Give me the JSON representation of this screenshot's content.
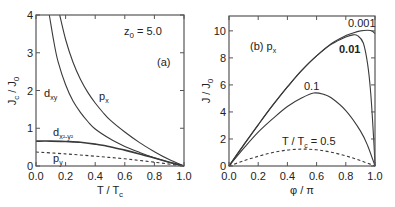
{
  "chart_data": [
    {
      "type": "line",
      "panel": "(a)",
      "annotation": "z0 = 5.0",
      "xlabel": "T / Tc",
      "ylabel": "Jc / J0",
      "xlim": [
        0.0,
        1.0
      ],
      "ylim": [
        0,
        4
      ],
      "xticks": [
        "0.0",
        "0.2",
        "0.4",
        "0.6",
        "0.8",
        "1.0"
      ],
      "yticks": [
        "0",
        "1",
        "2",
        "3",
        "4"
      ],
      "grid": false,
      "series": [
        {
          "name": "dxy",
          "style": "solid",
          "x": [
            0.09,
            0.12,
            0.15,
            0.2,
            0.25,
            0.3,
            0.35,
            0.4,
            0.5,
            0.6,
            0.7,
            0.8,
            0.9,
            1.0
          ],
          "y": [
            4.0,
            3.3,
            2.75,
            2.15,
            1.72,
            1.42,
            1.18,
            0.98,
            0.72,
            0.52,
            0.36,
            0.22,
            0.1,
            0.0
          ]
        },
        {
          "name": "px",
          "style": "solid",
          "x": [
            0.16,
            0.2,
            0.25,
            0.3,
            0.35,
            0.4,
            0.45,
            0.5,
            0.6,
            0.7,
            0.8,
            0.9,
            1.0
          ],
          "y": [
            4.0,
            3.35,
            2.75,
            2.3,
            1.95,
            1.67,
            1.43,
            1.22,
            0.9,
            0.62,
            0.38,
            0.17,
            0.0
          ]
        },
        {
          "name": "dx2-y2",
          "style": "solid-thick",
          "x": [
            0.0,
            0.1,
            0.2,
            0.3,
            0.4,
            0.5,
            0.6,
            0.7,
            0.8,
            0.9,
            1.0
          ],
          "y": [
            0.66,
            0.66,
            0.65,
            0.63,
            0.58,
            0.51,
            0.42,
            0.32,
            0.21,
            0.1,
            0.0
          ]
        },
        {
          "name": "py",
          "style": "dashed",
          "x": [
            0.0,
            0.2,
            0.4,
            0.6,
            0.8,
            1.0
          ],
          "y": [
            0.37,
            0.32,
            0.26,
            0.19,
            0.1,
            0.0
          ]
        }
      ],
      "labels": [
        {
          "text": "dxy",
          "x": 0.06,
          "y": 2.35
        },
        {
          "text": "px",
          "x": 0.43,
          "y": 1.85
        },
        {
          "text": "dx2-y2",
          "x": 0.07,
          "y": 0.78
        },
        {
          "text": "py",
          "x": 0.07,
          "y": 0.08
        }
      ]
    },
    {
      "type": "line",
      "panel": "(b) px",
      "xlabel": "φ / π",
      "ylabel": "J / J0",
      "xlim": [
        0.0,
        1.0
      ],
      "ylim": [
        0,
        11.1
      ],
      "xticks": [
        "0.0",
        "0.2",
        "0.4",
        "0.6",
        "0.8",
        "1.0"
      ],
      "yticks": [
        "0",
        "2",
        "4",
        "6",
        "8",
        "10"
      ],
      "grid": false,
      "series": [
        {
          "name": "T/Tc = 0.001",
          "style": "solid",
          "x": [
            0.0,
            0.1,
            0.2,
            0.3,
            0.4,
            0.5,
            0.6,
            0.7,
            0.8,
            0.85,
            0.9,
            0.95,
            0.98,
            1.0
          ],
          "y": [
            0.0,
            1.55,
            3.05,
            4.5,
            5.85,
            7.1,
            8.15,
            9.05,
            9.65,
            9.85,
            10.0,
            10.05,
            10.0,
            9.8
          ]
        },
        {
          "name": "T/Tc = 0.01",
          "style": "solid",
          "x": [
            0.0,
            0.1,
            0.2,
            0.3,
            0.4,
            0.5,
            0.6,
            0.7,
            0.8,
            0.85,
            0.88,
            0.92,
            0.95,
            0.97,
            0.99,
            1.0
          ],
          "y": [
            0.0,
            1.55,
            3.05,
            4.5,
            5.85,
            7.1,
            8.15,
            9.0,
            9.55,
            9.7,
            9.65,
            9.1,
            7.5,
            5.5,
            2.2,
            0.0
          ]
        },
        {
          "name": "T/Tc = 0.1",
          "style": "solid",
          "x": [
            0.0,
            0.1,
            0.2,
            0.3,
            0.4,
            0.5,
            0.58,
            0.65,
            0.7,
            0.8,
            0.9,
            0.95,
            1.0
          ],
          "y": [
            0.0,
            1.3,
            2.5,
            3.5,
            4.4,
            5.05,
            5.4,
            5.3,
            5.05,
            4.1,
            2.6,
            1.5,
            0.0
          ]
        },
        {
          "name": "T/Tc = 0.5",
          "style": "dashed",
          "x": [
            0.0,
            0.1,
            0.2,
            0.3,
            0.4,
            0.5,
            0.6,
            0.7,
            0.8,
            0.9,
            1.0
          ],
          "y": [
            0.0,
            0.38,
            0.72,
            1.0,
            1.18,
            1.25,
            1.2,
            1.02,
            0.75,
            0.4,
            0.0
          ]
        }
      ],
      "labels": [
        {
          "text": "0.001",
          "x": 0.86,
          "y": 10.45
        },
        {
          "text": "0.01",
          "x": 0.83,
          "y": 8.9
        },
        {
          "text": "0.1",
          "x": 0.5,
          "y": 5.9
        },
        {
          "text": "T / Tc = 0.5",
          "x": 0.4,
          "y": 1.75
        }
      ]
    }
  ],
  "panel_a": {
    "annotation_z0_main": "z",
    "annotation_z0_sub": "0",
    "annotation_z0_value": " = 5.0",
    "tag": "(a)",
    "ylabel_main1": "J",
    "ylabel_sub1": "c",
    "ylabel_sep": " / J",
    "ylabel_sub2": "0",
    "xlabel_main": "T / T",
    "xlabel_sub": "c",
    "label_dxy_main": "d",
    "label_dxy_sub": "xy",
    "label_px_main": "p",
    "label_px_sub": "x",
    "label_dx2y2_main": "d",
    "label_dx2y2_sub": "x²-y²",
    "label_py_main": "p",
    "label_py_sub": "y"
  },
  "panel_b": {
    "tag_main": "(b) p",
    "tag_sub": "x",
    "ylabel_main": "J / J",
    "ylabel_sub": "0",
    "xlabel": "φ / π",
    "label_0001": "0.001",
    "label_001": "0.01",
    "label_01": "0.1",
    "label_05_main": "T / T",
    "label_05_sub": "c",
    "label_05_value": " = 0.5"
  },
  "colors": {
    "line": "#3a3a3a",
    "frame": "#555555",
    "text": "#222222"
  }
}
